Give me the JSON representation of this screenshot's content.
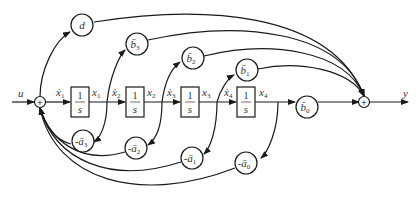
{
  "diagram": {
    "type": "state-variable signal flow block diagram (controllable canonical form)",
    "input_label": "u",
    "output_label": "y",
    "summing_junctions": [
      {
        "id": "input-sum",
        "symbol": "+"
      },
      {
        "id": "output-sum",
        "symbol": "+"
      }
    ],
    "integrators": [
      {
        "numerator": "1",
        "denominator": "s",
        "input": "ẋ",
        "input_sub": "1",
        "output": "x",
        "output_sub": "1"
      },
      {
        "numerator": "1",
        "denominator": "s",
        "input": "ẋ",
        "input_sub": "2",
        "output": "x",
        "output_sub": "2"
      },
      {
        "numerator": "1",
        "denominator": "s",
        "input": "ẋ",
        "input_sub": "3",
        "output": "x",
        "output_sub": "3"
      },
      {
        "numerator": "1",
        "denominator": "s",
        "input": "ẋ",
        "input_sub": "4",
        "output": "x",
        "output_sub": "4"
      }
    ],
    "feedforward_gains": [
      {
        "label": "d",
        "sub": ""
      },
      {
        "label": "b̄",
        "sub": "3"
      },
      {
        "label": "b̄",
        "sub": "2"
      },
      {
        "label": "b̄",
        "sub": "1"
      },
      {
        "label": "b̄",
        "sub": "0"
      }
    ],
    "feedback_gains": [
      {
        "label": "-ā",
        "sub": "3"
      },
      {
        "label": "-ā",
        "sub": "2"
      },
      {
        "label": "-ā",
        "sub": "1"
      },
      {
        "label": "-ā",
        "sub": "0"
      }
    ]
  }
}
